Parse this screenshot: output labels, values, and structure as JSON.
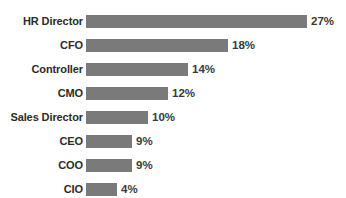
{
  "chart_data": {
    "type": "bar",
    "orientation": "horizontal",
    "title": "",
    "subtitle": "",
    "xlabel": "",
    "ylabel": "",
    "grid": false,
    "legend": false,
    "legend_position": "none",
    "value_suffix": "%",
    "xlim": [
      0,
      27
    ],
    "bar_color": "#7a7a7a",
    "label_color": "#2b2b2b",
    "value_color": "#3a3a3a",
    "background_color": "#ffffff",
    "categories": [
      "HR Director",
      "CFO",
      "Controller",
      "CMO",
      "Sales Director",
      "CEO",
      "COO",
      "CIO"
    ],
    "values": [
      27,
      18,
      14,
      12,
      10,
      9,
      9,
      4
    ],
    "value_labels": [
      "27%",
      "18%",
      "14%",
      "12%",
      "10%",
      "9%",
      "9%",
      "4%"
    ],
    "bars": [
      {
        "label": "HR Director",
        "value": 27,
        "value_label": "27%",
        "bar_px": 221
      },
      {
        "label": "CFO",
        "value": 18,
        "value_label": "18%",
        "bar_px": 142
      },
      {
        "label": "Controller",
        "value": 14,
        "value_label": "14%",
        "bar_px": 102
      },
      {
        "label": "CMO",
        "value": 12,
        "value_label": "12%",
        "bar_px": 82
      },
      {
        "label": "Sales Director",
        "value": 10,
        "value_label": "10%",
        "bar_px": 62
      },
      {
        "label": "CEO",
        "value": 9,
        "value_label": "9%",
        "bar_px": 46
      },
      {
        "label": "COO",
        "value": 9,
        "value_label": "9%",
        "bar_px": 46
      },
      {
        "label": "CIO",
        "value": 4,
        "value_label": "4%",
        "bar_px": 31
      }
    ]
  }
}
